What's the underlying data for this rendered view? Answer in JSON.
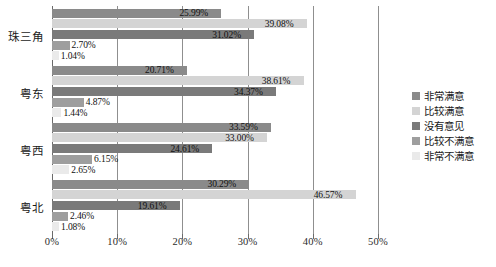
{
  "chart_data": {
    "type": "bar",
    "orientation": "horizontal",
    "title": "",
    "xlabel": "",
    "ylabel": "",
    "xlim": [
      0,
      50
    ],
    "grid": true,
    "legend_position": "right",
    "categories": [
      "珠三角",
      "粤东",
      "粤西",
      "粤北"
    ],
    "tick_labels": [
      "0%",
      "10%",
      "20%",
      "30%",
      "40%",
      "50%"
    ],
    "tick_values": [
      0,
      10,
      20,
      30,
      40,
      50
    ],
    "series": [
      {
        "name": "非常满意",
        "color": "#8a8a8a",
        "values": [
          25.99,
          20.71,
          33.59,
          30.29
        ],
        "labels": [
          "25.99%",
          "20.71%",
          "33.59%",
          "30.29%"
        ]
      },
      {
        "name": "比较满意",
        "color": "#d4d4d4",
        "values": [
          39.08,
          38.61,
          33.0,
          46.57
        ],
        "labels": [
          "39.08%",
          "38.61%",
          "33.00%",
          "46.57%"
        ]
      },
      {
        "name": "没有意见",
        "color": "#7a7a7a",
        "values": [
          31.02,
          34.37,
          24.61,
          19.61
        ],
        "labels": [
          "31.02%",
          "34.37%",
          "24.61%",
          "19.61%"
        ]
      },
      {
        "name": "比较不满意",
        "color": "#9e9e9e",
        "values": [
          2.7,
          4.87,
          6.15,
          2.46
        ],
        "labels": [
          "2.70%",
          "4.87%",
          "6.15%",
          "2.46%"
        ]
      },
      {
        "name": "非常不满意",
        "color": "#eaeaea",
        "values": [
          1.04,
          1.44,
          2.65,
          1.08
        ],
        "labels": [
          "1.04%",
          "1.44%",
          "2.65%",
          "1.08%"
        ]
      }
    ]
  },
  "caption": ""
}
